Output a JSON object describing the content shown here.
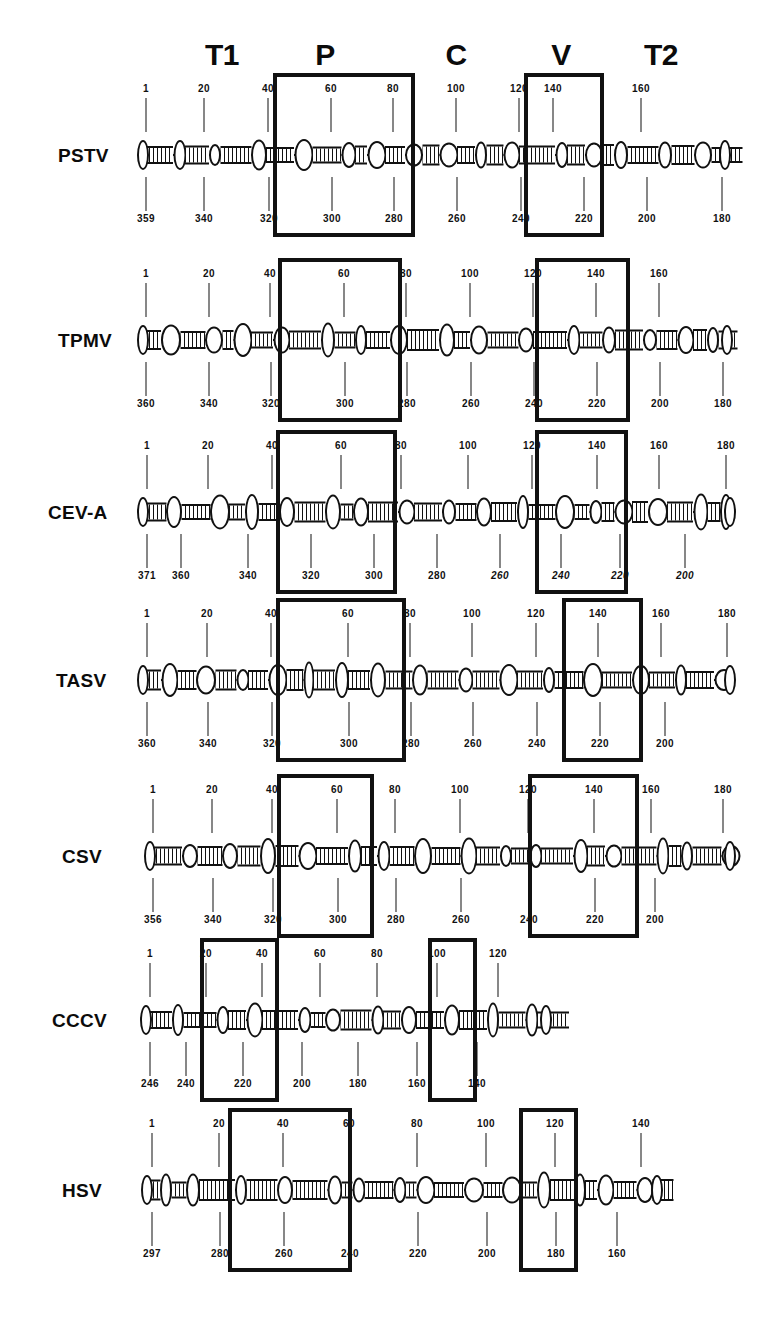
{
  "figure": {
    "domain_headers": [
      {
        "label": "T1",
        "x": 222
      },
      {
        "label": "P",
        "x": 325
      },
      {
        "label": "C",
        "x": 456
      },
      {
        "label": "V",
        "x": 561
      },
      {
        "label": "T2",
        "x": 661
      }
    ],
    "caption": ""
  },
  "rows": [
    {
      "name": "PSTV",
      "label": "PSTV",
      "rod": {
        "left": 143,
        "right": 725
      },
      "top_numbers": [
        "1",
        "20",
        "40",
        "60",
        "80",
        "100",
        "120",
        "140",
        "160"
      ],
      "top_x": [
        146,
        204,
        268,
        331,
        393,
        456,
        519,
        553,
        641
      ],
      "bottom_numbers": [
        "359",
        "340",
        "320",
        "300",
        "280",
        "260",
        "240",
        "220",
        "200",
        "180"
      ],
      "bottom_x": [
        146,
        204,
        269,
        332,
        394,
        457,
        521,
        584,
        647,
        722
      ],
      "bottom_italic": false,
      "brackets": [
        {
          "domain": "P",
          "left": 273,
          "right": 415
        },
        {
          "domain": "V",
          "left": 524,
          "right": 604
        }
      ]
    },
    {
      "name": "TPMV",
      "label": "TPMV",
      "rod": {
        "left": 143,
        "right": 727
      },
      "top_numbers": [
        "1",
        "20",
        "40",
        "60",
        "80",
        "100",
        "120",
        "140",
        "160"
      ],
      "top_x": [
        146,
        209,
        270,
        344,
        406,
        470,
        533,
        596,
        659
      ],
      "bottom_numbers": [
        "360",
        "340",
        "320",
        "300",
        "280",
        "260",
        "240",
        "220",
        "200",
        "180"
      ],
      "bottom_x": [
        146,
        209,
        271,
        345,
        407,
        471,
        534,
        597,
        660,
        723
      ],
      "bottom_italic": false,
      "brackets": [
        {
          "domain": "P",
          "left": 278,
          "right": 402
        },
        {
          "domain": "V",
          "left": 535,
          "right": 630
        }
      ]
    },
    {
      "name": "CEV-A",
      "label": "CEV-A",
      "rod": {
        "left": 143,
        "right": 730
      },
      "top_numbers": [
        "1",
        "20",
        "40",
        "60",
        "80",
        "100",
        "120",
        "140",
        "160",
        "180"
      ],
      "top_x": [
        147,
        208,
        272,
        341,
        401,
        468,
        532,
        597,
        659,
        726
      ],
      "bottom_numbers": [
        "371",
        "360",
        "340",
        "320",
        "300",
        "280",
        "260",
        "240",
        "220",
        "200"
      ],
      "bottom_x": [
        147,
        181,
        248,
        311,
        374,
        437,
        500,
        561,
        620,
        685
      ],
      "bottom_italic_from": 6,
      "brackets": [
        {
          "domain": "P",
          "left": 276,
          "right": 397
        },
        {
          "domain": "V",
          "left": 535,
          "right": 628
        }
      ]
    },
    {
      "name": "TASV",
      "label": "TASV",
      "rod": {
        "left": 143,
        "right": 730
      },
      "top_numbers": [
        "1",
        "20",
        "40",
        "60",
        "80",
        "100",
        "120",
        "140",
        "160",
        "180"
      ],
      "top_x": [
        147,
        207,
        271,
        348,
        410,
        472,
        536,
        598,
        661,
        727
      ],
      "bottom_numbers": [
        "360",
        "340",
        "320",
        "300",
        "280",
        "260",
        "240",
        "220",
        "200"
      ],
      "bottom_x": [
        147,
        208,
        272,
        349,
        411,
        473,
        537,
        600,
        665
      ],
      "bottom_italic": false,
      "brackets": [
        {
          "domain": "P",
          "left": 276,
          "right": 406
        },
        {
          "domain": "V",
          "left": 562,
          "right": 643
        }
      ]
    },
    {
      "name": "CSV",
      "label": "CSV",
      "rod": {
        "left": 150,
        "right": 730
      },
      "top_numbers": [
        "1",
        "20",
        "40",
        "60",
        "80",
        "100",
        "120",
        "140",
        "160",
        "180"
      ],
      "top_x": [
        153,
        212,
        272,
        337,
        395,
        460,
        528,
        594,
        651,
        723
      ],
      "bottom_numbers": [
        "356",
        "340",
        "320",
        "300",
        "280",
        "260",
        "240",
        "220",
        "200"
      ],
      "bottom_x": [
        153,
        213,
        273,
        338,
        396,
        461,
        529,
        595,
        655
      ],
      "bottom_italic": false,
      "brackets": [
        {
          "domain": "P",
          "left": 277,
          "right": 374
        },
        {
          "domain": "V",
          "left": 528,
          "right": 639
        }
      ]
    },
    {
      "name": "CCCV",
      "label": "CCCV",
      "rod": {
        "left": 146,
        "right": 546
      },
      "top_numbers": [
        "1",
        "20",
        "40",
        "60",
        "80",
        "100",
        "120"
      ],
      "top_x": [
        150,
        206,
        262,
        320,
        377,
        437,
        498
      ],
      "bottom_numbers": [
        "246",
        "240",
        "220",
        "200",
        "180",
        "160",
        "140"
      ],
      "bottom_x": [
        150,
        186,
        243,
        302,
        358,
        417,
        477
      ],
      "bottom_italic": false,
      "brackets": [
        {
          "domain": "P",
          "left": 200,
          "right": 279
        },
        {
          "domain": "V",
          "left": 428,
          "right": 477
        }
      ]
    },
    {
      "name": "HSV",
      "label": "HSV",
      "rod": {
        "left": 147,
        "right": 657
      },
      "top_numbers": [
        "1",
        "20",
        "40",
        "60",
        "80",
        "100",
        "120",
        "140"
      ],
      "top_x": [
        152,
        219,
        283,
        349,
        417,
        486,
        555,
        641
      ],
      "bottom_numbers": [
        "297",
        "280",
        "260",
        "240",
        "220",
        "200",
        "180",
        "160"
      ],
      "bottom_x": [
        152,
        220,
        284,
        350,
        418,
        487,
        556,
        617
      ],
      "bottom_italic": false,
      "brackets": [
        {
          "domain": "P",
          "left": 228,
          "right": 352
        },
        {
          "domain": "V",
          "left": 519,
          "right": 578
        }
      ]
    }
  ],
  "legend": {
    "domain_names": {
      "T1": "Terminal left domain",
      "P": "Pathogenicity domain",
      "C": "Central conserved domain",
      "V": "Variable domain",
      "T2": "Terminal right domain"
    }
  },
  "colors": {
    "ink": "#111111",
    "paper": "#ffffff"
  }
}
